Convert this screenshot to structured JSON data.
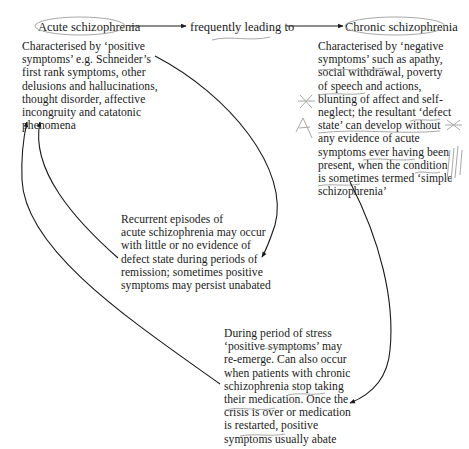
{
  "diagram": {
    "nodes": {
      "acute": {
        "title": "Acute schizophrenia",
        "description": "Characterised by ‘positive\nsymptoms’ e.g. Schneider’s\nfirst rank symptoms, other\ndelusions and hallucinations,\nthought disorder, affective\nincongruity and catatonic\nphenomena"
      },
      "connector": {
        "label": "frequently leading to"
      },
      "chronic": {
        "title": "Chronic schizophrenia",
        "description": "Characterised by ‘negative\nsymptoms’ such as apathy,\nsocial withdrawal, poverty\nof speech and actions,\nblunting of affect and self-\nneglect; the resultant ‘defect\nstate’ can develop without\nany evidence of acute\nsymptoms ever having been\npresent, when the condition\nis sometimes termed ‘simple\nschizophrenia’"
      },
      "recurrent": {
        "description": "Recurrent episodes of\nacute schizophrenia may occur\nwith little or no evidence of\ndefect state during periods of\nremission; sometimes positive\nsymptoms may persist unabated"
      },
      "stress": {
        "description": "During period of stress\n‘positive symptoms’ may\nre-emerge. Can also occur\nwhen patients with chronic\nschizophrenia stop taking\ntheir medication. Once the\ncrisis is over or medication\nis restarted, positive\nsymptoms usually abate"
      }
    },
    "edges": [
      {
        "from": "acute",
        "to": "chronic",
        "label": "frequently leading to"
      },
      {
        "from": "acute",
        "to": "recurrent"
      },
      {
        "from": "recurrent",
        "to": "acute"
      },
      {
        "from": "chronic",
        "to": "stress"
      },
      {
        "from": "stress",
        "to": "acute"
      }
    ],
    "colors": {
      "ink": "#1a1a1a",
      "pencil": "#9a9a9a"
    }
  }
}
